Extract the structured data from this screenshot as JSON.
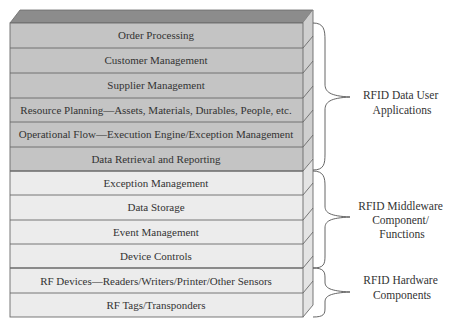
{
  "diagram": {
    "colors": {
      "top_face": "#8c8c8c",
      "application_fill": "#c4c4c4",
      "application_side": "#cfcfcf",
      "middleware_fill": "#ececec",
      "middleware_side": "#e2e2e2",
      "hardware_fill": "#ececec",
      "line": "#6a6a6a",
      "brace": "#555555"
    },
    "layers": [
      {
        "label": "Order Processing",
        "group": "applications"
      },
      {
        "label": "Customer Management",
        "group": "applications"
      },
      {
        "label": "Supplier Management",
        "group": "applications"
      },
      {
        "label": "Resource Planning—Assets, Materials, Durables, People, etc.",
        "group": "applications"
      },
      {
        "label": "Operational Flow—Execution Engine/Exception Management",
        "group": "applications"
      },
      {
        "label": "Data Retrieval and Reporting",
        "group": "applications"
      },
      {
        "label": "Exception Management",
        "group": "middleware"
      },
      {
        "label": "Data Storage",
        "group": "middleware"
      },
      {
        "label": "Event Management",
        "group": "middleware"
      },
      {
        "label": "Device Controls",
        "group": "middleware"
      },
      {
        "label": "RF Devices—Readers/Writers/Printer/Other Sensors",
        "group": "hardware"
      },
      {
        "label": "RF Tags/Transponders",
        "group": "hardware"
      }
    ],
    "groups": [
      {
        "id": "applications",
        "lines": [
          "RFID Data User",
          "Applications"
        ]
      },
      {
        "id": "middleware",
        "lines": [
          "RFID Middleware",
          "Component/",
          "Functions"
        ]
      },
      {
        "id": "hardware",
        "lines": [
          "RFID Hardware",
          "Components"
        ]
      }
    ]
  }
}
